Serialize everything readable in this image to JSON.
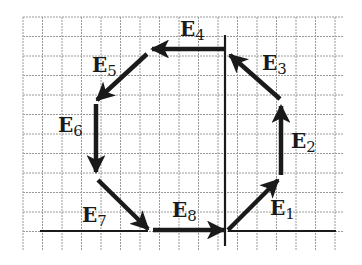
{
  "colors": {
    "background": "#ffffff",
    "grid": "#9a9a9a",
    "ink": "#1a1a1a"
  },
  "grid": {
    "x0": 23,
    "y0": 17,
    "x1": 344,
    "y1": 250,
    "cell": 19.5
  },
  "axes": {
    "horizontal_left": {
      "x1": 40,
      "y1": 231,
      "x2": 148,
      "y2": 231
    },
    "horizontal_right": {
      "x1": 228,
      "y1": 231,
      "x2": 336,
      "y2": 231
    },
    "vertical_top": {
      "x1": 225,
      "y1": 35,
      "x2": 225,
      "y2": 50
    },
    "vertical": {
      "x1": 225,
      "y1": 50,
      "x2": 225,
      "y2": 246
    }
  },
  "vectors": [
    {
      "id": "E1",
      "label": "E",
      "sub": "1",
      "x1": 228,
      "y1": 230,
      "x2": 278,
      "y2": 180,
      "lx": 270,
      "ly": 215
    },
    {
      "id": "E2",
      "label": "E",
      "sub": "2",
      "x1": 281,
      "y1": 175,
      "x2": 281,
      "y2": 106,
      "lx": 291,
      "ly": 148
    },
    {
      "id": "E3",
      "label": "E",
      "sub": "3",
      "x1": 280,
      "y1": 99,
      "x2": 230,
      "y2": 55,
      "lx": 262,
      "ly": 70
    },
    {
      "id": "E4",
      "label": "E",
      "sub": "4",
      "x1": 225,
      "y1": 49,
      "x2": 152,
      "y2": 49,
      "lx": 180,
      "ly": 36
    },
    {
      "id": "E5",
      "label": "E",
      "sub": "5",
      "x1": 147,
      "y1": 54,
      "x2": 97,
      "y2": 100,
      "lx": 92,
      "ly": 72
    },
    {
      "id": "E6",
      "label": "E",
      "sub": "6",
      "x1": 96,
      "y1": 104,
      "x2": 96,
      "y2": 172,
      "lx": 58,
      "ly": 132
    },
    {
      "id": "E7",
      "label": "E",
      "sub": "7",
      "x1": 98,
      "y1": 180,
      "x2": 148,
      "y2": 229,
      "lx": 82,
      "ly": 222
    },
    {
      "id": "E8",
      "label": "E",
      "sub": "8",
      "x1": 153,
      "y1": 230,
      "x2": 224,
      "y2": 230,
      "lx": 172,
      "ly": 217
    }
  ]
}
